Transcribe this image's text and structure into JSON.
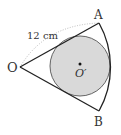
{
  "diagram": {
    "type": "geometry",
    "points": {
      "O": {
        "label": "O",
        "x": 20,
        "y": 67
      },
      "A": {
        "label": "A",
        "x": 99,
        "y": 23
      },
      "B": {
        "label": "B",
        "x": 99,
        "y": 111
      },
      "O_prime": {
        "label": "O′",
        "x": 80,
        "y": 65
      }
    },
    "radius_label": "12 cm",
    "inscribed_circle": {
      "cx": 80,
      "cy": 66,
      "r": 30
    },
    "colors": {
      "stroke": "#222222",
      "circle_fill": "#d9d9d9",
      "circle_stroke": "#555555",
      "dotted_arc": "#aaaaaa",
      "text": "#333333"
    }
  }
}
